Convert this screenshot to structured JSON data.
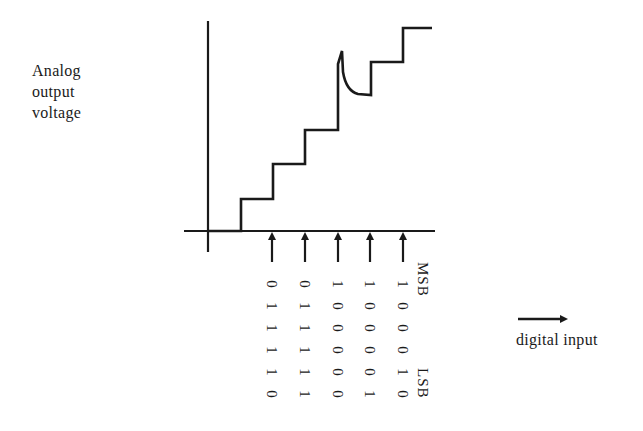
{
  "diagram": {
    "type": "DAC staircase output with glitch",
    "y_axis_label": [
      "Analog",
      "output",
      "voltage"
    ],
    "x_axis_label": "digital input",
    "bit_order_labels": {
      "top": "MSB",
      "bottom": "LSB"
    },
    "input_codes": [
      {
        "code": "011110",
        "bits": [
          "0",
          "1",
          "1",
          "1",
          "1",
          "0"
        ]
      },
      {
        "code": "011111",
        "bits": [
          "0",
          "1",
          "1",
          "1",
          "1",
          "1"
        ]
      },
      {
        "code": "100000",
        "bits": [
          "1",
          "0",
          "0",
          "0",
          "0",
          "0"
        ]
      },
      {
        "code": "100001",
        "bits": [
          "1",
          "0",
          "0",
          "0",
          "0",
          "1"
        ]
      },
      {
        "code": "100010",
        "bits": [
          "1",
          "0",
          "0",
          "0",
          "1",
          "0"
        ]
      }
    ],
    "annotation": "glitch spike at major carry transition 011111 -> 100000",
    "colors": {
      "line": "#1a1a1a",
      "background": "#ffffff"
    }
  }
}
